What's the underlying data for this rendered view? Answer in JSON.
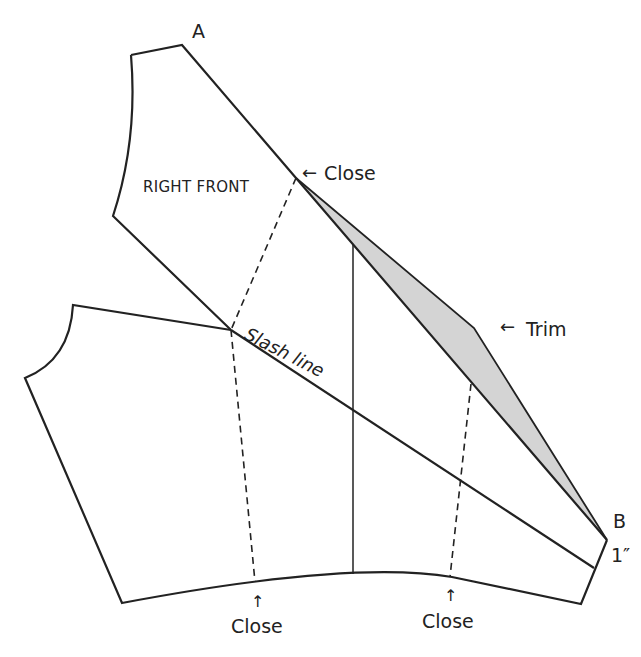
{
  "figure": {
    "type": "sewing pattern alteration diagram",
    "pieces": [
      "right front",
      "back/side piece"
    ],
    "colors": {
      "line": "#222222",
      "trim_fill": "#cfcfcf",
      "background": "#ffffff"
    }
  },
  "labels": {
    "point_a": "A",
    "point_b": "B",
    "right_front": "RIGHT FRONT",
    "close_top": "Close",
    "trim": "Trim",
    "slash_line": "Slash line",
    "one_inch": "1″",
    "close_bottom_left": "Close",
    "close_bottom_right": "Close"
  },
  "arrows": {
    "left": "←",
    "up": "↑"
  }
}
